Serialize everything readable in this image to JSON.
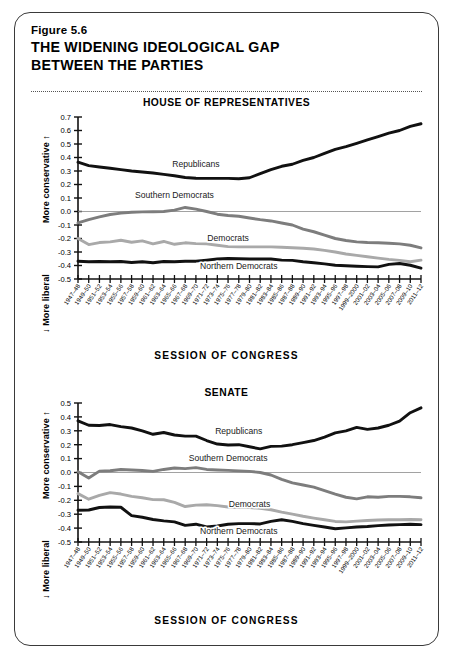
{
  "figure": {
    "number": "Figure 5.6",
    "title_line1": "THE WIDENING IDEOLOGICAL GAP",
    "title_line2": "BETWEEN THE PARTIES"
  },
  "axis_titles": {
    "x": "SESSION OF CONGRESS",
    "y_top": "More conservative  ↑",
    "y_bottom": "↓  More liberal"
  },
  "colors": {
    "republicans": "#111111",
    "southern_democrats": "#7d7d7d",
    "democrats": "#a9a9a9",
    "northern_democrats": "#111111",
    "axis": "#111111",
    "zero_line": "#8a8a8a",
    "border": "#3a3a3a"
  },
  "categories": [
    "1947–48",
    "1949–50",
    "1951–52",
    "1953–54",
    "1955–56",
    "1957–58",
    "1959–60",
    "1961–62",
    "1963–64",
    "1965–66",
    "1967–68",
    "1969–70",
    "1971–72",
    "1973–74",
    "1975–76",
    "1977–78",
    "1979–80",
    "1981–82",
    "1983–84",
    "1985–86",
    "1987–88",
    "1989–90",
    "1991–92",
    "1993–94",
    "1995–96",
    "1997–98",
    "1999–2000",
    "2001–02",
    "2003–04",
    "2005–06",
    "2007–08",
    "2009–10",
    "2011–12"
  ],
  "chart_data": [
    {
      "type": "line",
      "title": "HOUSE OF REPRESENTATIVES",
      "xlabel": "SESSION OF CONGRESS",
      "ylabel": "More conservative ↑ / ↓ More liberal",
      "ylim": [
        -0.5,
        0.7
      ],
      "yticks": [
        -0.5,
        -0.4,
        -0.3,
        -0.2,
        -0.1,
        0.0,
        0.1,
        0.2,
        0.3,
        0.4,
        0.5,
        0.6,
        0.7
      ],
      "ytick_labels": [
        "-0.5",
        "-0.4",
        "-0.3",
        "-0.2",
        "-0.1",
        "0.0",
        "0.1",
        "0.2",
        "0.3",
        "0.4",
        "0.5",
        "0.6",
        "0.7"
      ],
      "grid": false,
      "zero_line": true,
      "legend_position": "inline-annotations",
      "categories": [
        "1947–48",
        "1949–50",
        "1951–52",
        "1953–54",
        "1955–56",
        "1957–58",
        "1959–60",
        "1961–62",
        "1963–64",
        "1965–66",
        "1967–68",
        "1969–70",
        "1971–72",
        "1973–74",
        "1975–76",
        "1977–78",
        "1979–80",
        "1981–82",
        "1983–84",
        "1985–86",
        "1987–88",
        "1989–90",
        "1991–92",
        "1993–94",
        "1995–96",
        "1997–98",
        "1999–2000",
        "2001–02",
        "2003–04",
        "2005–06",
        "2007–08",
        "2009–10",
        "2011–12"
      ],
      "series": [
        {
          "name": "Republicans",
          "color": "#111111",
          "width": 2.9,
          "label_x_index": 11,
          "label_y": 0.33,
          "values": [
            0.365,
            0.34,
            0.33,
            0.32,
            0.31,
            0.3,
            0.293,
            0.285,
            0.275,
            0.265,
            0.252,
            0.246,
            0.245,
            0.245,
            0.245,
            0.243,
            0.25,
            0.28,
            0.31,
            0.335,
            0.35,
            0.378,
            0.4,
            0.43,
            0.46,
            0.48,
            0.505,
            0.53,
            0.555,
            0.58,
            0.6,
            0.63,
            0.65
          ]
        },
        {
          "name": "Southern Democrats",
          "color": "#7d7d7d",
          "width": 2.9,
          "label_x_index": 9,
          "label_y": 0.1,
          "values": [
            -0.085,
            -0.06,
            -0.04,
            -0.022,
            -0.012,
            -0.006,
            -0.003,
            -0.002,
            0.0,
            0.01,
            0.03,
            0.018,
            0.0,
            -0.02,
            -0.03,
            -0.035,
            -0.048,
            -0.06,
            -0.07,
            -0.085,
            -0.1,
            -0.13,
            -0.15,
            -0.175,
            -0.2,
            -0.215,
            -0.225,
            -0.23,
            -0.232,
            -0.235,
            -0.24,
            -0.25,
            -0.27
          ]
        },
        {
          "name": "Democrats",
          "color": "#a9a9a9",
          "width": 2.9,
          "label_x_index": 14,
          "label_y": -0.215,
          "values": [
            -0.2,
            -0.245,
            -0.23,
            -0.225,
            -0.213,
            -0.228,
            -0.218,
            -0.24,
            -0.222,
            -0.243,
            -0.232,
            -0.238,
            -0.24,
            -0.25,
            -0.26,
            -0.262,
            -0.262,
            -0.262,
            -0.262,
            -0.265,
            -0.268,
            -0.272,
            -0.278,
            -0.288,
            -0.3,
            -0.315,
            -0.325,
            -0.335,
            -0.345,
            -0.355,
            -0.362,
            -0.372,
            -0.36
          ]
        },
        {
          "name": "Northern Democrats",
          "color": "#111111",
          "width": 2.9,
          "label_x_index": 15,
          "label_y": -0.425,
          "values": [
            -0.368,
            -0.372,
            -0.37,
            -0.372,
            -0.37,
            -0.378,
            -0.372,
            -0.38,
            -0.37,
            -0.372,
            -0.368,
            -0.368,
            -0.36,
            -0.352,
            -0.348,
            -0.35,
            -0.352,
            -0.352,
            -0.352,
            -0.36,
            -0.362,
            -0.372,
            -0.38,
            -0.388,
            -0.398,
            -0.402,
            -0.405,
            -0.408,
            -0.41,
            -0.392,
            -0.385,
            -0.398,
            -0.42
          ]
        }
      ]
    },
    {
      "type": "line",
      "title": "SENATE",
      "xlabel": "SESSION OF CONGRESS",
      "ylabel": "More conservative ↑ / ↓ More liberal",
      "ylim": [
        -0.5,
        0.5
      ],
      "yticks": [
        -0.5,
        -0.4,
        -0.3,
        -0.2,
        -0.1,
        0.0,
        0.1,
        0.2,
        0.3,
        0.4,
        0.5
      ],
      "ytick_labels": [
        "-0.5",
        "-0.4",
        "-0.3",
        "-0.2",
        "-0.1",
        "0.0",
        "0.1",
        "0.2",
        "0.3",
        "0.4",
        "0.5"
      ],
      "grid": false,
      "zero_line": true,
      "legend_position": "inline-annotations",
      "categories": [
        "1947–48",
        "1949–50",
        "1951–52",
        "1953–54",
        "1955–56",
        "1957–58",
        "1959–60",
        "1961–62",
        "1963–64",
        "1965–66",
        "1967–68",
        "1969–70",
        "1971–72",
        "1973–74",
        "1975–76",
        "1977–78",
        "1979–80",
        "1981–82",
        "1983–84",
        "1985–86",
        "1987–88",
        "1989–90",
        "1991–92",
        "1993–94",
        "1995–96",
        "1997–98",
        "1999–2000",
        "2001–02",
        "2003–04",
        "2005–06",
        "2007–08",
        "2009–10",
        "2011–12"
      ],
      "series": [
        {
          "name": "Republicans",
          "color": "#111111",
          "width": 2.9,
          "label_x_index": 15,
          "label_y": 0.275,
          "values": [
            0.372,
            0.34,
            0.338,
            0.345,
            0.33,
            0.32,
            0.3,
            0.275,
            0.288,
            0.27,
            0.262,
            0.262,
            0.23,
            0.205,
            0.198,
            0.2,
            0.185,
            0.17,
            0.188,
            0.19,
            0.2,
            0.215,
            0.23,
            0.255,
            0.285,
            0.3,
            0.325,
            0.31,
            0.32,
            0.34,
            0.37,
            0.43,
            0.465
          ]
        },
        {
          "name": "Southern Democrats",
          "color": "#7d7d7d",
          "width": 2.9,
          "label_x_index": 14,
          "label_y": 0.085,
          "values": [
            0.005,
            -0.04,
            0.01,
            0.013,
            0.022,
            0.018,
            0.014,
            0.008,
            0.022,
            0.032,
            0.028,
            0.035,
            0.022,
            0.018,
            0.015,
            0.012,
            0.008,
            0.0,
            -0.018,
            -0.05,
            -0.075,
            -0.09,
            -0.105,
            -0.13,
            -0.155,
            -0.178,
            -0.19,
            -0.175,
            -0.178,
            -0.172,
            -0.172,
            -0.175,
            -0.182
          ]
        },
        {
          "name": "Democrats",
          "color": "#a9a9a9",
          "width": 2.9,
          "label_x_index": 16,
          "label_y": -0.248,
          "values": [
            -0.152,
            -0.192,
            -0.165,
            -0.145,
            -0.155,
            -0.172,
            -0.182,
            -0.195,
            -0.196,
            -0.215,
            -0.245,
            -0.235,
            -0.232,
            -0.238,
            -0.248,
            -0.252,
            -0.252,
            -0.258,
            -0.268,
            -0.285,
            -0.3,
            -0.315,
            -0.328,
            -0.34,
            -0.352,
            -0.355,
            -0.35,
            -0.345,
            -0.342,
            -0.34,
            -0.34,
            -0.338,
            -0.34
          ]
        },
        {
          "name": "Northern Democrats",
          "color": "#111111",
          "width": 2.9,
          "label_x_index": 15,
          "label_y": -0.445,
          "values": [
            -0.272,
            -0.27,
            -0.252,
            -0.248,
            -0.25,
            -0.31,
            -0.322,
            -0.338,
            -0.348,
            -0.355,
            -0.38,
            -0.372,
            -0.392,
            -0.385,
            -0.372,
            -0.368,
            -0.368,
            -0.37,
            -0.352,
            -0.34,
            -0.352,
            -0.368,
            -0.38,
            -0.392,
            -0.405,
            -0.398,
            -0.392,
            -0.388,
            -0.382,
            -0.378,
            -0.375,
            -0.372,
            -0.375
          ]
        }
      ]
    }
  ]
}
